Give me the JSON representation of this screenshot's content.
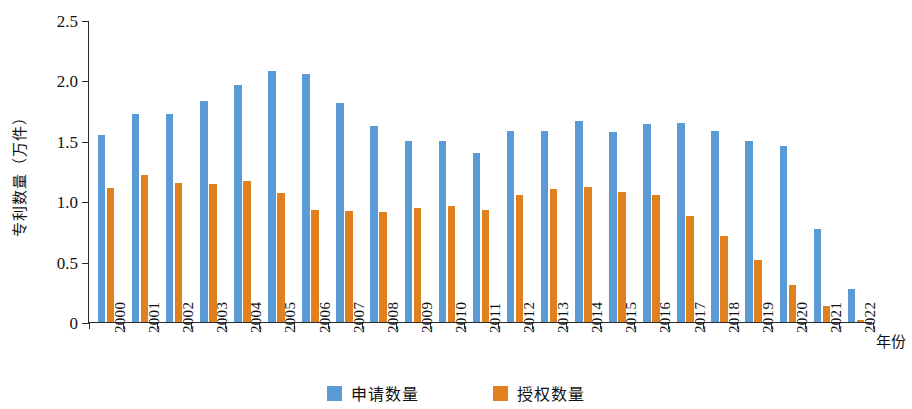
{
  "chart_data": {
    "type": "bar",
    "title": "",
    "xlabel": "年份",
    "ylabel": "专利数量（万件）",
    "ylim": [
      0,
      2.5
    ],
    "ytick_labels": [
      "0",
      "0.5",
      "1.0",
      "1.5",
      "2.0",
      "2.5"
    ],
    "ytick_values": [
      0,
      0.5,
      1.0,
      1.5,
      2.0,
      2.5
    ],
    "grid": false,
    "legend_position": "bottom-center",
    "categories": [
      "2000",
      "2001",
      "2002",
      "2003",
      "2004",
      "2005",
      "2006",
      "2007",
      "2008",
      "2009",
      "2010",
      "2011",
      "2012",
      "2013",
      "2014",
      "2015",
      "2016",
      "2017",
      "2018",
      "2019",
      "2020",
      "2021",
      "2022"
    ],
    "series": [
      {
        "name": "申请数量",
        "color": "#5B9BD5",
        "values": [
          1.55,
          1.72,
          1.72,
          1.83,
          1.96,
          2.08,
          2.05,
          1.81,
          1.62,
          1.5,
          1.5,
          1.4,
          1.58,
          1.58,
          1.66,
          1.57,
          1.64,
          1.65,
          1.58,
          1.5,
          1.46,
          0.77,
          0.27
        ]
      },
      {
        "name": "授权数量",
        "color": "#E0801F",
        "values": [
          1.11,
          1.22,
          1.15,
          1.14,
          1.17,
          1.07,
          0.93,
          0.92,
          0.91,
          0.94,
          0.96,
          0.93,
          1.05,
          1.1,
          1.12,
          1.08,
          1.05,
          0.88,
          0.71,
          0.51,
          0.31,
          0.13,
          0.02
        ]
      }
    ]
  },
  "legend": {
    "items": [
      {
        "label": "申请数量",
        "color": "#5B9BD5"
      },
      {
        "label": "授权数量",
        "color": "#E0801F"
      }
    ]
  }
}
